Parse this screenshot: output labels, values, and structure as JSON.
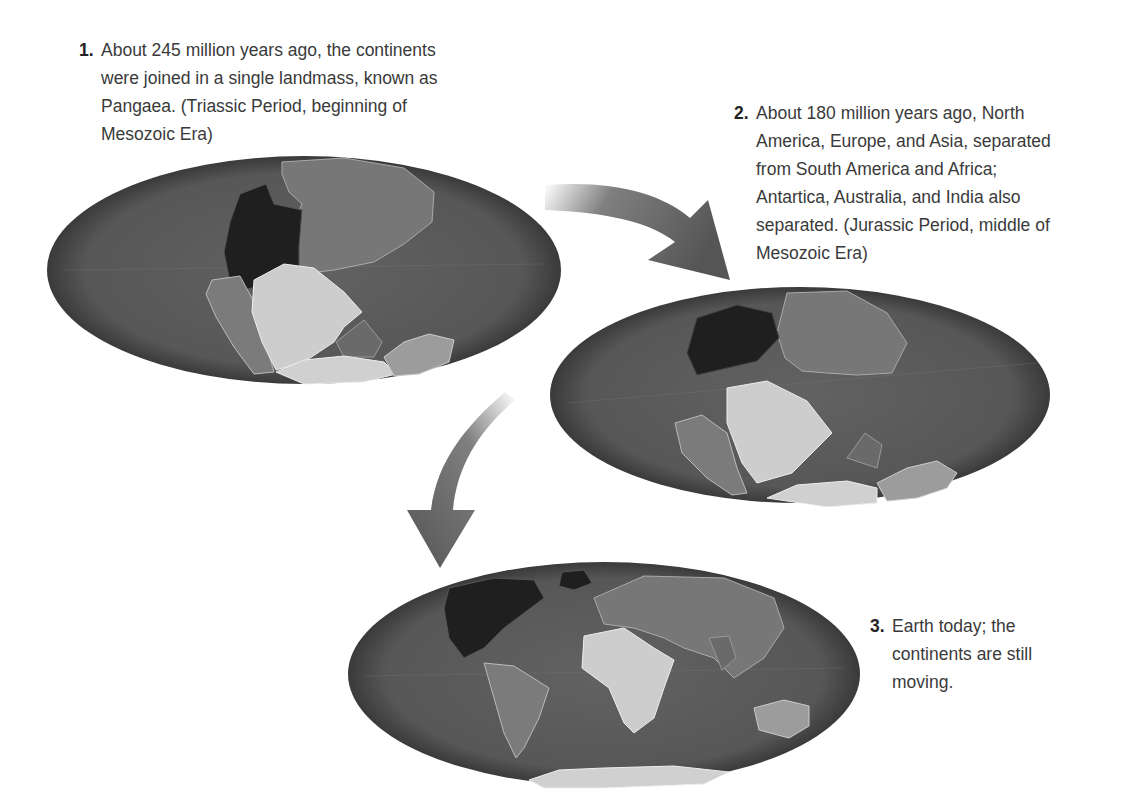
{
  "figure": {
    "colors": {
      "ocean": "#5c5c5c",
      "ocean_edge": "#3a3a3a",
      "north_america": "#1f1f1f",
      "eurasia": "#777777",
      "south_america": "#7b7b7b",
      "africa": "#cdcdcd",
      "india": "#6a6a6a",
      "australia": "#9c9c9c",
      "antarctica": "#d0d0d0",
      "arrow": "#555555"
    },
    "stages": [
      {
        "number": "1.",
        "text_lines": [
          "About 245 million years ago, the continents",
          "were joined in a single landmass, known as",
          "Pangaea. (Triassic Period, beginning of",
          "Mesozoic Era)"
        ],
        "globe_label": "Pangaea globe"
      },
      {
        "number": "2.",
        "text_lines": [
          "About 180 million years ago, North",
          "America, Europe, and Asia, separated",
          "from South America and Africa;",
          "Antartica, Australia, and India also",
          "separated. (Jurassic Period, middle of",
          "Mesozoic Era)"
        ],
        "globe_label": "Jurassic globe"
      },
      {
        "number": "3.",
        "text_lines": [
          "Earth today; the",
          "continents are still",
          "moving."
        ],
        "globe_label": "Present-day globe"
      }
    ],
    "arrows": [
      {
        "from": "stage-1",
        "to": "stage-2",
        "direction": "right-down"
      },
      {
        "from": "stage-2",
        "to": "stage-3",
        "direction": "down-left"
      }
    ]
  }
}
